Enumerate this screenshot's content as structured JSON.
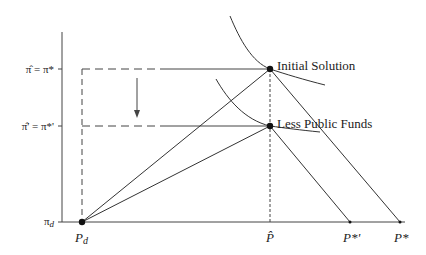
{
  "diagram": {
    "y_axis_labels": {
      "initial": "π̂ = π*",
      "reduced": "π̂' = π*'",
      "origin": "π",
      "origin_sub": "d"
    },
    "x_axis_labels": {
      "pd": "P",
      "pd_sub": "d",
      "p_hat": "P̂",
      "p_star_prime": "P*'",
      "p_star": "P*"
    },
    "points": {
      "initial_solution": "Initial Solution",
      "less_public_funds": "Less Public Funds"
    },
    "colors": {
      "line": "#333333",
      "text": "#222222",
      "background": "#ffffff"
    }
  }
}
